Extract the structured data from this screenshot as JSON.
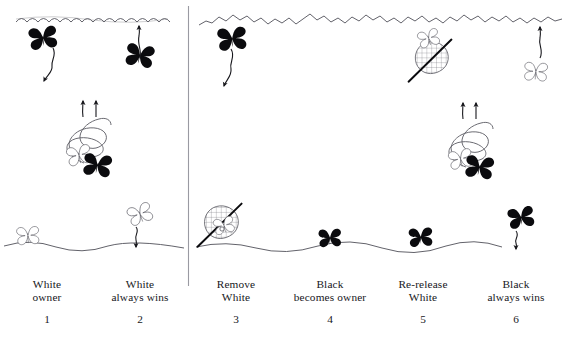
{
  "figure": {
    "type": "scientific-illustration-sequence",
    "panel_count": 6,
    "halves": 2,
    "colors": {
      "ink": "#17171c",
      "line": "#5a5a62",
      "background": "#ffffff",
      "black_butterfly": "#0b0b0e",
      "white_butterfly_outline": "#5a5a62",
      "net_mesh": "#6e6e76",
      "divider": "#9a9aa2"
    },
    "scenery": {
      "left_canopy_style": "scalloped",
      "right_canopy_style": "jagged",
      "ground_style": "wavy"
    }
  },
  "panels": [
    {
      "number": "1",
      "caption_line1": "White",
      "caption_line2": "owner",
      "center_x": 47,
      "elements": [
        {
          "name": "black-butterfly-at-canopy",
          "color": "black",
          "position": "canopy-left"
        },
        {
          "name": "descending-arrow",
          "direction": "down"
        },
        {
          "name": "black-butterfly-at-canopy-right",
          "color": "black",
          "position": "canopy-right"
        },
        {
          "name": "ascending-arrow",
          "direction": "up"
        },
        {
          "name": "spiral-flight-pair",
          "arrows": 2,
          "butterflies": [
            "white",
            "black"
          ]
        },
        {
          "name": "white-butterfly-on-ground",
          "color": "white"
        }
      ]
    },
    {
      "number": "2",
      "caption_line1": "White",
      "caption_line2": "always wins",
      "center_x": 140,
      "elements": [
        {
          "name": "white-butterfly-descending",
          "color": "white"
        },
        {
          "name": "descending-arrow",
          "direction": "down"
        }
      ]
    },
    {
      "number": "3",
      "caption_line1": "Remove",
      "caption_line2": "White",
      "center_x": 236,
      "elements": [
        {
          "name": "black-butterfly-at-canopy",
          "color": "black"
        },
        {
          "name": "descending-arrow",
          "direction": "down"
        },
        {
          "name": "butterfly-net",
          "position": "ground",
          "contains": "white-butterfly"
        }
      ]
    },
    {
      "number": "4",
      "caption_line1": "Black",
      "caption_line2": "becomes owner",
      "center_x": 330,
      "elements": [
        {
          "name": "black-butterfly-on-ground",
          "color": "black"
        }
      ]
    },
    {
      "number": "5",
      "caption_line1": "Re-release",
      "caption_line2": "White",
      "center_x": 423,
      "elements": [
        {
          "name": "butterfly-net",
          "position": "canopy",
          "releases": "white-butterfly"
        },
        {
          "name": "white-butterfly-released",
          "color": "white"
        },
        {
          "name": "spiral-flight-pair",
          "arrows": 2,
          "butterflies": [
            "white",
            "black"
          ]
        },
        {
          "name": "black-butterfly-on-ground",
          "color": "black"
        }
      ]
    },
    {
      "number": "6",
      "caption_line1": "Black",
      "caption_line2": "always wins",
      "center_x": 516,
      "elements": [
        {
          "name": "white-butterfly-ascending",
          "color": "white"
        },
        {
          "name": "ascending-arrow",
          "direction": "up"
        },
        {
          "name": "black-butterfly-descending",
          "color": "black"
        },
        {
          "name": "descending-arrow",
          "direction": "down"
        }
      ]
    }
  ]
}
